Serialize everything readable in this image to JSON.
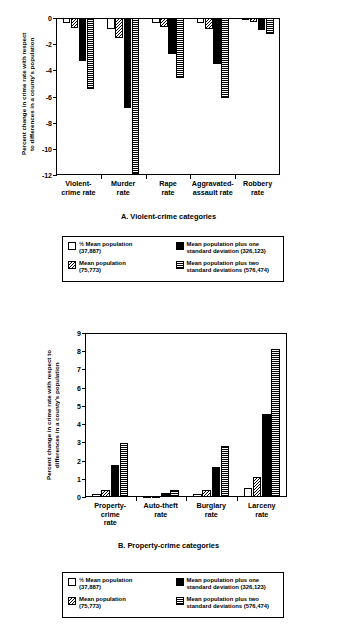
{
  "figure": {
    "background": "#ffffff",
    "ink": "#000000"
  },
  "legend": {
    "items": [
      {
        "key": "half-mean",
        "pattern": "white",
        "label": "½ Mean population\n(37,887)"
      },
      {
        "key": "plus-one-sd",
        "pattern": "solid-black",
        "label": "Mean population plus one\n    standard deviation (326,123)"
      },
      {
        "key": "mean",
        "pattern": "diagonal",
        "label": "Mean population\n(75,773)"
      },
      {
        "key": "plus-two-sd",
        "pattern": "horizontal",
        "label": "Mean population plus two\n    standard deviations (576,474)"
      }
    ]
  },
  "chart_data": [
    {
      "id": "panel-a",
      "type": "bar",
      "title": "A. Violent-crime categories",
      "xlabel": "",
      "ylabel": "Percent change in crime rate with respect\nto differences in a county's population",
      "categories": [
        "Violent-\ncrime rate",
        "Murder\nrate",
        "Rape\nrate",
        "Aggravated-\nassault rate",
        "Robbery\nrate"
      ],
      "ylim": [
        -12,
        0
      ],
      "yticks": [
        0,
        -2,
        -4,
        -6,
        -8,
        -10,
        -12
      ],
      "ytick_labels": [
        "0",
        "-2",
        "-4",
        "-6",
        "-8",
        "-10",
        "-12"
      ],
      "grid": false,
      "legend_position": "below",
      "series": [
        {
          "name": "½ Mean population (37,887)",
          "pattern": "white",
          "values": [
            -0.35,
            -0.85,
            -0.35,
            -0.35,
            -0.1
          ]
        },
        {
          "name": "Mean population (75,773)",
          "pattern": "diagonal",
          "values": [
            -0.75,
            -1.55,
            -0.7,
            -0.85,
            -0.3
          ]
        },
        {
          "name": "Mean population plus one standard deviation (326,123)",
          "pattern": "solid-black",
          "values": [
            -3.25,
            -6.85,
            -2.75,
            -3.55,
            -0.9
          ]
        },
        {
          "name": "Mean population plus two standard deviations (576,474)",
          "pattern": "horizontal",
          "values": [
            -5.45,
            -11.9,
            -4.55,
            -6.1,
            -1.25
          ]
        }
      ]
    },
    {
      "id": "panel-b",
      "type": "bar",
      "title": "B. Property-crime categories",
      "xlabel": "",
      "ylabel": "Percent change in crime rate with respect to\ndifferences in a county's population",
      "categories": [
        "Property-\ncrime\nrate",
        "Auto-theft\nrate",
        "Burglary\nrate",
        "Larceny\nrate"
      ],
      "ylim": [
        0,
        9
      ],
      "yticks": [
        0,
        1,
        2,
        3,
        4,
        5,
        6,
        7,
        8,
        9
      ],
      "ytick_labels": [
        "0",
        "1",
        "2",
        "3",
        "4",
        "5",
        "6",
        "7",
        "8",
        "9"
      ],
      "grid": false,
      "legend_position": "below",
      "series": [
        {
          "name": "½ Mean population (37,887)",
          "pattern": "white",
          "values": [
            0.15,
            0.05,
            0.15,
            0.5
          ]
        },
        {
          "name": "Mean population (75,773)",
          "pattern": "diagonal",
          "values": [
            0.4,
            0.08,
            0.4,
            1.1
          ]
        },
        {
          "name": "Mean population plus one standard deviation (326,123)",
          "pattern": "solid-black",
          "values": [
            1.75,
            0.22,
            1.62,
            4.58
          ]
        },
        {
          "name": "Mean population plus two standard deviations (576,474)",
          "pattern": "horizontal",
          "values": [
            2.97,
            0.4,
            2.82,
            8.1
          ]
        }
      ]
    }
  ]
}
